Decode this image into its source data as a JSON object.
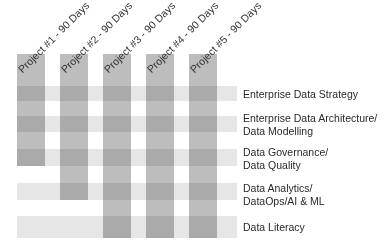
{
  "diagram": {
    "projects": [
      {
        "label": "Project #1 - 90 Days",
        "left": 17,
        "top": 54,
        "bottom": 166
      },
      {
        "label": "Project #2 - 90 Days",
        "left": 60,
        "top": 54,
        "bottom": 200
      },
      {
        "label": "Project #3 - 90 Days",
        "left": 103,
        "top": 54,
        "bottom": 238
      },
      {
        "label": "Project #4 - 90 Days",
        "left": 146,
        "top": 54,
        "bottom": 238
      },
      {
        "label": "Project #5 - 90 Days",
        "left": 189,
        "top": 54,
        "bottom": 238
      }
    ],
    "workstreams": [
      {
        "line1": "Enterprise Data Strategy",
        "line2": "",
        "band_top": 86,
        "band_bottom": 101,
        "label_top": 88
      },
      {
        "line1": "Enterprise Data Architecture/",
        "line2": "Data Modelling",
        "band_top": 116,
        "band_bottom": 132,
        "label_top": 112
      },
      {
        "line1": "Data Governance/",
        "line2": "Data Quality",
        "band_top": 149,
        "band_bottom": 166,
        "label_top": 146
      },
      {
        "line1": "Data Analytics/",
        "line2": "DataOps/AI & ML",
        "band_top": 183,
        "band_bottom": 200,
        "label_top": 182
      },
      {
        "line1": "Data Literacy",
        "line2": "",
        "band_top": 216,
        "band_bottom": 238,
        "label_top": 221
      }
    ],
    "colors": {
      "column": "#bdbdbd",
      "band": "#e6e6e6",
      "text": "#2a2a2a"
    }
  }
}
